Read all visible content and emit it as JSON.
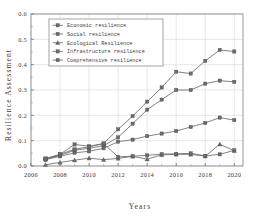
{
  "chart_data": {
    "type": "line",
    "title": "",
    "xlabel": "Years",
    "ylabel": "Resilience Assessment",
    "xlim": [
      2006,
      2020.6
    ],
    "ylim": [
      0.0,
      0.6
    ],
    "xticks": [
      2006,
      2008,
      2010,
      2012,
      2014,
      2016,
      2018,
      2020
    ],
    "xtick_labels": [
      "2006",
      "2008",
      "2010",
      "2012",
      "2014",
      "2016",
      "2018",
      "2020"
    ],
    "yticks": [
      0.0,
      0.1,
      0.2,
      0.3,
      0.4,
      0.5,
      0.6
    ],
    "ytick_labels": [
      "0.0",
      "0.1",
      "0.2",
      "0.3",
      "0.4",
      "0.5",
      "0.6"
    ],
    "grid": true,
    "legend_position": "upper-left",
    "x": [
      2007,
      2008,
      2009,
      2010,
      2011,
      2012,
      2013,
      2014,
      2015,
      2016,
      2017,
      2018,
      2019,
      2020
    ],
    "series": [
      {
        "name": "Economic resilience",
        "marker": "square",
        "color": "#6b6b6b",
        "values": [
          0.028,
          0.042,
          0.062,
          0.07,
          0.08,
          0.113,
          0.167,
          0.222,
          0.262,
          0.3,
          0.3,
          0.325,
          0.337,
          0.332
        ]
      },
      {
        "name": "Social resilience",
        "marker": "square",
        "color": "#6b6b6b",
        "values": [
          0.026,
          0.038,
          0.052,
          0.058,
          0.07,
          0.096,
          0.104,
          0.118,
          0.128,
          0.138,
          0.154,
          0.17,
          0.191,
          0.181
        ]
      },
      {
        "name": "Ecological Resilience",
        "marker": "triangle",
        "color": "#6b6b6b",
        "values": [
          0.005,
          0.014,
          0.023,
          0.031,
          0.025,
          0.03,
          0.038,
          0.027,
          0.044,
          0.046,
          0.046,
          0.039,
          0.086,
          0.06
        ]
      },
      {
        "name": "Infrastructure resilience",
        "marker": "square",
        "color": "#6b6b6b",
        "values": [
          0.024,
          0.046,
          0.085,
          0.078,
          0.088,
          0.036,
          0.039,
          0.042,
          0.047,
          0.048,
          0.05,
          0.04,
          0.046,
          0.062
        ]
      },
      {
        "name": "Comprehensive resilience",
        "marker": "square",
        "color": "#6b6b6b",
        "values": [
          0.03,
          0.046,
          0.066,
          0.076,
          0.089,
          0.145,
          0.197,
          0.254,
          0.31,
          0.372,
          0.365,
          0.415,
          0.458,
          0.452
        ]
      }
    ]
  }
}
